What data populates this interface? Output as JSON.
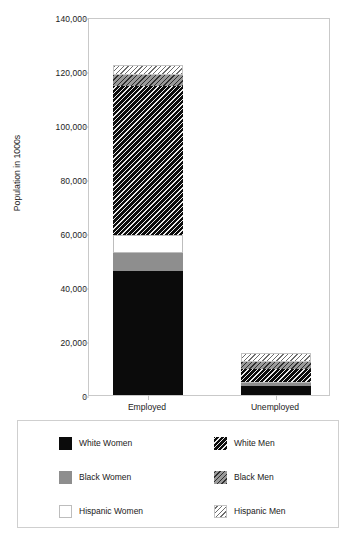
{
  "chart_data": {
    "type": "bar",
    "subtype": "stacked-vertical",
    "title": "",
    "xlabel": "",
    "ylabel": "Population in 1000s",
    "categories": [
      "Employed",
      "Unemployed"
    ],
    "ylim": [
      0,
      140000
    ],
    "yticks": [
      0,
      20000,
      40000,
      60000,
      80000,
      100000,
      120000,
      140000
    ],
    "ytick_labels": [
      "0",
      "20,000",
      "40,000",
      "60,000",
      "80,000",
      "100,000",
      "120,000",
      "140,000"
    ],
    "grid": false,
    "legend_position": "below-plot",
    "stack_order_bottom_to_top": [
      "White Women",
      "Black Women",
      "Hispanic Women",
      "White Men",
      "Black Men",
      "Hispanic Men"
    ],
    "series": [
      {
        "name": "White Women",
        "values": [
          46000,
          3400
        ],
        "fill": "solid-black",
        "color": "#0b0b0b"
      },
      {
        "name": "Black Women",
        "values": [
          6700,
          900
        ],
        "fill": "solid-gray",
        "color": "#8e8e8e"
      },
      {
        "name": "Hispanic Women",
        "values": [
          6700,
          700
        ],
        "fill": "solid-white",
        "color": "#ffffff"
      },
      {
        "name": "White Men",
        "values": [
          55000,
          4800
        ],
        "fill": "hatch-black",
        "color": "#0d0d0d"
      },
      {
        "name": "Black Men",
        "values": [
          4000,
          2600
        ],
        "fill": "hatch-gray",
        "color": "#9a9a9a"
      },
      {
        "name": "Hispanic Men",
        "values": [
          3700,
          3000
        ],
        "fill": "hatch-white",
        "color": "#ffffff"
      }
    ],
    "totals": [
      122100,
      15400
    ]
  },
  "axes": {
    "y_title": "Population in 1000s",
    "y_ticks": [
      {
        "value": 140000,
        "label": "140,000"
      },
      {
        "value": 120000,
        "label": "120,000"
      },
      {
        "value": 100000,
        "label": "100,000"
      },
      {
        "value": 80000,
        "label": "80,000"
      },
      {
        "value": 60000,
        "label": "60,000"
      },
      {
        "value": 40000,
        "label": "40,000"
      },
      {
        "value": 20000,
        "label": "20,000"
      },
      {
        "value": 0,
        "label": "0"
      }
    ],
    "x_categories": [
      {
        "label": "Employed"
      },
      {
        "label": "Unemployed"
      }
    ]
  },
  "legend": {
    "entries": [
      {
        "label": "White Women",
        "swatch": "solid-black-swatch",
        "column": 0,
        "row": 0
      },
      {
        "label": "Black Women",
        "swatch": "solid-gray-swatch",
        "column": 0,
        "row": 1
      },
      {
        "label": "Hispanic Women",
        "swatch": "solid-white-swatch",
        "column": 0,
        "row": 2
      },
      {
        "label": "White Men",
        "swatch": "hatch-black-swatch",
        "column": 1,
        "row": 0
      },
      {
        "label": "Black Men",
        "swatch": "hatch-gray-swatch",
        "column": 1,
        "row": 1
      },
      {
        "label": "Hispanic Men",
        "swatch": "hatch-white-swatch",
        "column": 1,
        "row": 2
      }
    ]
  },
  "colors": {
    "black": "#0b0b0b",
    "gray": "#8e8e8e",
    "white": "#ffffff",
    "frame": "#c9c9c9",
    "text": "#1a1a1a"
  }
}
